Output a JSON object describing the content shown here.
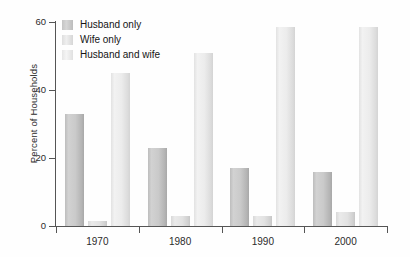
{
  "chart_data": {
    "type": "bar",
    "title": "",
    "subtitle": "",
    "xlabel": "",
    "ylabel": "Percent of Households",
    "categories": [
      "1970",
      "1980",
      "1990",
      "2000"
    ],
    "series": [
      {
        "name": "Husband only",
        "values": [
          33,
          23,
          17,
          16
        ],
        "color": "#c8c8c8"
      },
      {
        "name": "Wife only",
        "values": [
          1.5,
          3,
          3,
          4
        ],
        "color": "#e4e4e4"
      },
      {
        "name": "Husband and wife",
        "values": [
          45,
          51,
          58.5,
          58.5
        ],
        "color": "#ededed"
      }
    ],
    "ylim": [
      0,
      60
    ],
    "yticks": [
      0,
      20,
      40,
      60
    ],
    "ytick_labels": [
      "0",
      "20",
      "40",
      "60"
    ],
    "grid": false,
    "legend_position": "top-left-inside",
    "bar_group_gap": true
  },
  "legend": {
    "items": [
      {
        "label": "Husband only"
      },
      {
        "label": "Wife only"
      },
      {
        "label": "Husband and wife"
      }
    ]
  }
}
